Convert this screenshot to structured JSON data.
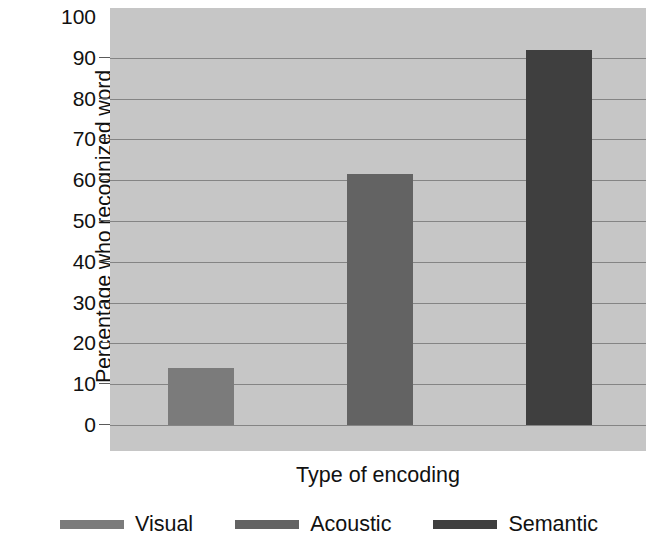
{
  "chart_data": {
    "type": "bar",
    "title": "",
    "subtitle": "",
    "xlabel": "Type of encoding",
    "ylabel": "Percentage who recognized word",
    "categories": [
      "Visual",
      "Acoustic",
      "Semantic"
    ],
    "values": [
      14,
      61.5,
      92
    ],
    "series": [
      {
        "name": "Percentage who recognized word",
        "values": [
          14,
          61.5,
          92
        ]
      }
    ],
    "ylim": [
      0,
      100
    ],
    "ytick_labels": [
      "0",
      "10",
      "20",
      "30",
      "40",
      "50",
      "60",
      "70",
      "80",
      "90",
      "100"
    ],
    "ytick_values": [
      0,
      10,
      20,
      30,
      40,
      50,
      60,
      70,
      80,
      90,
      100
    ],
    "grid": true,
    "grid_axis": "y",
    "legend_position": "bottom",
    "bar_colors": [
      "#7b7b7b",
      "#636363",
      "#3f3f3f"
    ],
    "plot_background": "#c6c6c6",
    "gridline_color": "#6e6e6e",
    "legend": [
      {
        "label": "Visual",
        "color": "#7b7b7b"
      },
      {
        "label": "Acoustic",
        "color": "#636363"
      },
      {
        "label": "Semantic",
        "color": "#3f3f3f"
      }
    ]
  }
}
